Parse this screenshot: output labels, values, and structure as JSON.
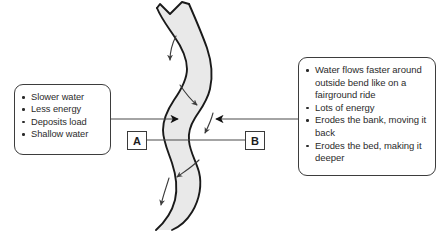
{
  "diagram": {
    "river": {
      "name": "meandering-river-channel",
      "fill_color": "#e9e9e9",
      "outline_color": "#1a1a1a",
      "flow_arrow_count": 5,
      "flow_direction": "downstream"
    },
    "callout_left": {
      "name": "inside-bend-callout",
      "target_label": "A",
      "items": [
        "Slower water",
        "Less energy",
        "Deposits load",
        "Shallow water"
      ]
    },
    "callout_right": {
      "name": "outside-bend-callout",
      "target_label": "B",
      "items": [
        "Water flows faster around outside bend like on a fairground ride",
        "Lots of energy",
        "Erodes the bank, moving it back",
        "Erodes the bed, making it deeper"
      ]
    },
    "markers": {
      "a_label": "A",
      "b_label": "B"
    },
    "colors": {
      "water_fill": "#e9e9e9",
      "outline": "#1a1a1a",
      "box_border": "#3d3d3d",
      "text": "#2b2b2b",
      "leader_line": "#4a4a4a",
      "background": "#ffffff"
    }
  }
}
